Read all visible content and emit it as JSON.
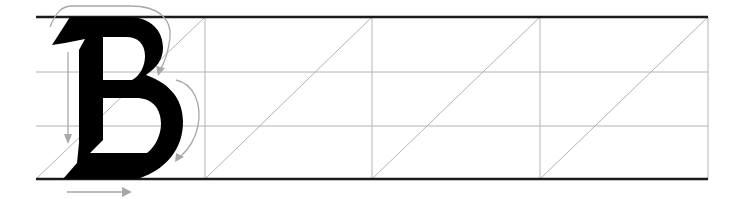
{
  "sheet": {
    "title": "Blackletter capital B practice sheet",
    "letter": "B",
    "width": 741,
    "height": 199,
    "colors": {
      "background": "#ffffff",
      "rule_thick": "#1a1a1a",
      "grid": "#b4b4b4",
      "glyph": "#000000",
      "arrow": "#a8a8a8"
    },
    "rules": {
      "left": 36,
      "right": 708,
      "top_line_y": 17,
      "bottom_line_y": 179,
      "mid_lines_y": [
        72,
        126
      ],
      "column_lines_x": [
        205,
        372,
        540,
        708
      ]
    },
    "slant_guides": [
      {
        "x1": 36,
        "y1": 179,
        "x2": 205,
        "y2": 17
      },
      {
        "x1": 205,
        "y1": 179,
        "x2": 372,
        "y2": 17
      },
      {
        "x1": 372,
        "y1": 179,
        "x2": 540,
        "y2": 17
      },
      {
        "x1": 540,
        "y1": 179,
        "x2": 708,
        "y2": 17
      }
    ],
    "stroke_arrows": [
      {
        "id": "arrow-1",
        "description": "downstroke of stem",
        "direction": "down"
      },
      {
        "id": "arrow-2",
        "description": "upper bowl curve",
        "direction": "clockwise"
      },
      {
        "id": "arrow-3",
        "description": "lower bowl curve",
        "direction": "clockwise"
      },
      {
        "id": "arrow-4",
        "description": "base stroke",
        "direction": "right"
      }
    ]
  }
}
